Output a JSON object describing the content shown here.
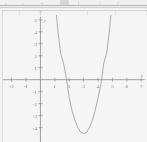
{
  "window": {
    "toolbar": {
      "visible_fragments": [
        "⌄",
        "⌐",
        "¬",
        "⊙",
        "|",
        "∕",
        "∕"
      ],
      "note_label": "T"
    }
  },
  "chart_data": {
    "type": "line",
    "title": "",
    "subtitle": "",
    "xlabel": "x",
    "ylabel": "y",
    "grid": false,
    "legend": "none",
    "xlim": [
      -2.6,
      7.4
    ],
    "ylim": [
      -5.2,
      5.4
    ],
    "x_ticks": [
      -2,
      -1,
      1,
      2,
      3,
      4,
      5,
      6,
      7
    ],
    "x_tick_labels": [
      "-2",
      "-1",
      "1",
      "2",
      "3",
      "4",
      "5",
      "6",
      "7"
    ],
    "y_ticks": [
      -4,
      -3,
      -2,
      -1,
      1,
      2,
      3,
      4,
      5
    ],
    "y_tick_labels": [
      "-4",
      "-3",
      "-2",
      "-1",
      "1",
      "2",
      "3",
      "4",
      "5"
    ],
    "curve": {
      "name": "parabola",
      "equation": "y = 3(x - 3)^2 - 4.5",
      "vertex": [
        3,
        -4.5
      ],
      "roots": [
        1.78,
        4.22
      ],
      "opens": "up",
      "color": "#9a9a9a",
      "x": [
        1.05,
        1.2,
        1.4,
        1.6,
        1.8,
        2.0,
        2.2,
        2.4,
        2.6,
        2.8,
        3.0,
        3.2,
        3.4,
        3.6,
        3.8,
        4.0,
        4.2,
        4.4,
        4.6,
        4.8,
        4.95
      ],
      "y": [
        6.2,
        4.2,
        2.2,
        1.4,
        0.1,
        -1.5,
        -2.6,
        -3.4,
        -4.0,
        -4.4,
        -4.5,
        -4.4,
        -4.0,
        -3.4,
        -2.6,
        -1.5,
        -0.4,
        1.4,
        2.2,
        4.2,
        6.2
      ]
    }
  },
  "axes_names": {
    "x_axis_label": "x",
    "y_axis_label": "y"
  }
}
